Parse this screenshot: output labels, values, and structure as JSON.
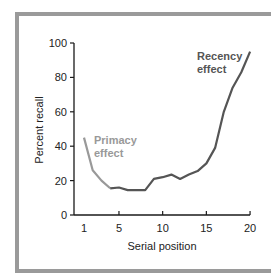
{
  "chart_data": {
    "type": "line",
    "title": "",
    "xlabel": "Serial position",
    "ylabel": "Percent recall",
    "xlim": [
      1,
      20
    ],
    "ylim": [
      0,
      100
    ],
    "x_ticks": [
      1,
      5,
      10,
      15,
      20
    ],
    "y_ticks": [
      0,
      20,
      40,
      60,
      80,
      100
    ],
    "grid": false,
    "x": [
      1,
      2,
      3,
      4,
      5,
      6,
      7,
      8,
      9,
      10,
      11,
      12,
      13,
      14,
      15,
      16,
      17,
      18,
      19,
      20
    ],
    "series": [
      {
        "name": "Percent recall",
        "values": [
          45,
          26,
          20,
          15.5,
          16,
          14.5,
          14.5,
          14.5,
          21,
          22,
          23.5,
          21,
          23.5,
          25.5,
          30,
          39,
          60,
          74,
          83,
          95
        ],
        "color": "#555555",
        "primacy_color": "#999999"
      }
    ],
    "annotations": [
      {
        "text_line1": "Primacy",
        "text_line2": "effect",
        "x": 2.5,
        "y": 42,
        "color": "#999999"
      },
      {
        "text_line1": "Recency",
        "text_line2": "effect",
        "x": 14.5,
        "y": 92,
        "color": "#555555"
      }
    ]
  },
  "labels": {
    "xlabel": "Serial position",
    "ylabel": "Percent recall",
    "primacy_1": "Primacy",
    "primacy_2": "effect",
    "recency_1": "Recency",
    "recency_2": "effect",
    "xt": [
      "1",
      "5",
      "10",
      "15",
      "20"
    ],
    "yt": [
      "0",
      "20",
      "40",
      "60",
      "80",
      "100"
    ]
  }
}
